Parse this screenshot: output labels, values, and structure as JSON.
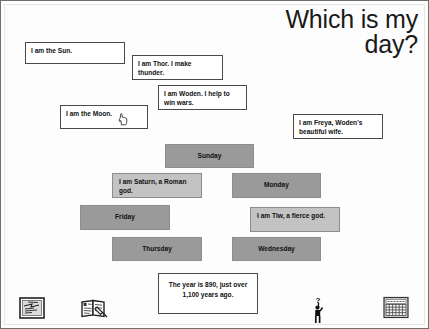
{
  "slide": {
    "title": "Which is my day?",
    "background_color": "#fdfdfd",
    "border_color": "#6e6e6e"
  },
  "fact_boxes": [
    {
      "id": "sun",
      "text": "I am the Sun."
    },
    {
      "id": "thor",
      "text": "I am Thor.  I make thunder."
    },
    {
      "id": "woden",
      "text": "I am Woden.  I help to win wars."
    },
    {
      "id": "moon",
      "text": "I am the Moon."
    },
    {
      "id": "freya",
      "text": "I am Freya, Woden's beautiful wife."
    }
  ],
  "tiles": [
    {
      "id": "sunday",
      "text": "Sunday",
      "style": "dark",
      "color": "#9a9a9a"
    },
    {
      "id": "saturn",
      "text": "I am Saturn,\na Roman god.",
      "style": "light",
      "color": "#c3c3c3"
    },
    {
      "id": "monday",
      "text": "Monday",
      "style": "dark",
      "color": "#9a9a9a"
    },
    {
      "id": "friday",
      "text": "Friday",
      "style": "dark",
      "color": "#9a9a9a"
    },
    {
      "id": "tiw",
      "text": "I am Tiw,\na fierce god.",
      "style": "light",
      "color": "#c3c3c3"
    },
    {
      "id": "thursday",
      "text": "Thursday",
      "style": "dark",
      "color": "#9a9a9a"
    },
    {
      "id": "wednesday",
      "text": "Wednesday",
      "style": "dark",
      "color": "#9a9a9a"
    }
  ],
  "year_box": {
    "text": "The year is 890, just over 1,100 years ago."
  },
  "nav_icons": [
    {
      "id": "picture",
      "name": "picture-icon"
    },
    {
      "id": "book",
      "name": "book-pencil-icon"
    },
    {
      "id": "question",
      "name": "person-question-icon",
      "glyph": "?"
    },
    {
      "id": "grid",
      "name": "calendar-grid-icon"
    }
  ],
  "cursor": {
    "kind": "pointing-hand"
  }
}
